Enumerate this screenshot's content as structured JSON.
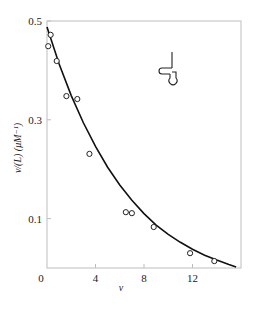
{
  "chart_data": {
    "type": "scatter",
    "title": "",
    "xlabel": "ν",
    "ylabel": "ν/(L)  (μM⁻¹)",
    "xlim": [
      0,
      16
    ],
    "ylim": [
      0,
      0.5
    ],
    "x_ticks": [
      0,
      4,
      8,
      12
    ],
    "x_tick_labels": [
      "0",
      "4",
      "8",
      "12"
    ],
    "y_ticks": [
      0.1,
      0.3,
      0.5
    ],
    "y_tick_labels": [
      "0.1",
      "0.3",
      "0.5"
    ],
    "grid": false,
    "legend": null,
    "series": [
      {
        "name": "observed",
        "marker": "open-circle",
        "points": [
          {
            "x": 0.1,
            "y": 0.449
          },
          {
            "x": 0.3,
            "y": 0.472
          },
          {
            "x": 0.8,
            "y": 0.419
          },
          {
            "x": 1.6,
            "y": 0.348
          },
          {
            "x": 2.5,
            "y": 0.342
          },
          {
            "x": 3.5,
            "y": 0.231
          },
          {
            "x": 6.5,
            "y": 0.113
          },
          {
            "x": 7.0,
            "y": 0.111
          },
          {
            "x": 8.8,
            "y": 0.083
          },
          {
            "x": 11.8,
            "y": 0.03
          },
          {
            "x": 13.8,
            "y": 0.014
          }
        ]
      },
      {
        "name": "fitted curve",
        "marker": "line",
        "points": [
          {
            "x": 0.0,
            "y": 0.488
          },
          {
            "x": 1.0,
            "y": 0.413
          },
          {
            "x": 2.0,
            "y": 0.349
          },
          {
            "x": 3.0,
            "y": 0.294
          },
          {
            "x": 4.0,
            "y": 0.246
          },
          {
            "x": 5.0,
            "y": 0.204
          },
          {
            "x": 6.0,
            "y": 0.168
          },
          {
            "x": 7.0,
            "y": 0.137
          },
          {
            "x": 8.0,
            "y": 0.11
          },
          {
            "x": 9.0,
            "y": 0.087
          },
          {
            "x": 10.0,
            "y": 0.068
          },
          {
            "x": 11.0,
            "y": 0.052
          },
          {
            "x": 12.0,
            "y": 0.038
          },
          {
            "x": 13.0,
            "y": 0.026
          },
          {
            "x": 14.0,
            "y": 0.016
          },
          {
            "x": 15.0,
            "y": 0.007
          },
          {
            "x": 15.6,
            "y": 0.002
          }
        ]
      }
    ],
    "annotations": [
      {
        "type": "inset-icon",
        "description": "DNA hairpin-like structure symbol",
        "position": "upper-right"
      }
    ]
  },
  "labels": {
    "x_axis": "ν",
    "y_axis": "ν/(L)  (μM⁻¹)"
  }
}
